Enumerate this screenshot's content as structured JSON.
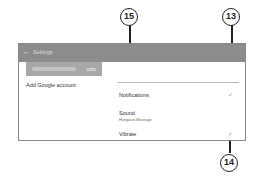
{
  "header": {
    "back_icon": "←",
    "title": "Settings"
  },
  "sidebar": {
    "account_suffix": "com",
    "add_account": "Add Google account"
  },
  "settings": [
    {
      "label": "Notifications",
      "checked": true,
      "check": "✓"
    },
    {
      "label": "Sound",
      "sub": "Hangouts Message"
    },
    {
      "label": "Vibrate",
      "checked": true,
      "check": "✓"
    }
  ],
  "callouts": {
    "a": "15",
    "b": "13",
    "c": "14"
  }
}
